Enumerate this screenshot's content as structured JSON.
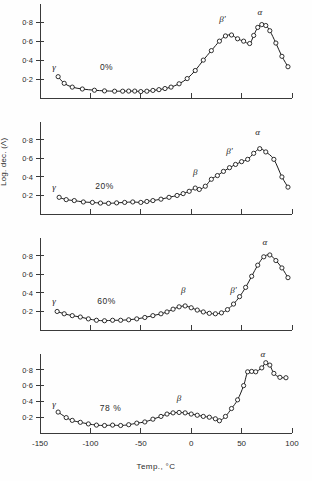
{
  "figure": {
    "xlabel": "Temp., °C",
    "ylabel": "Log. dec. (Λ)",
    "xticks": [
      "-150",
      "-100",
      "-50",
      "0",
      "50",
      "100"
    ],
    "xtick_values": [
      -150,
      -100,
      -50,
      0,
      50,
      100
    ],
    "yticks": [
      "0·2",
      "0·4",
      "0·6",
      "0·8"
    ],
    "ytick_values": [
      0.2,
      0.4,
      0.6,
      0.8
    ],
    "xlim": [
      -150,
      100
    ],
    "ylim": [
      0,
      0.95
    ],
    "grid": false,
    "legend": "none",
    "marker": "open-circle",
    "line_color": "#1a1a1a"
  },
  "chart_data": [
    {
      "type": "line",
      "title": "0%",
      "panel_label": "0%",
      "xlabel": "",
      "ylabel": "Log. dec. (Λ)",
      "xlim": [
        -150,
        100
      ],
      "ylim": [
        0,
        0.95
      ],
      "grid": false,
      "x": [
        -132,
        -126,
        -118,
        -108,
        -96,
        -86,
        -76,
        -68,
        -62,
        -56,
        -50,
        -44,
        -38,
        -32,
        -26,
        -20,
        -12,
        -4,
        4,
        12,
        20,
        28,
        34,
        40,
        46,
        52,
        58,
        62,
        66,
        70,
        74,
        78,
        84,
        90,
        96
      ],
      "y": [
        0.225,
        0.155,
        0.115,
        0.095,
        0.082,
        0.075,
        0.072,
        0.072,
        0.073,
        0.073,
        0.068,
        0.072,
        0.08,
        0.088,
        0.1,
        0.115,
        0.15,
        0.205,
        0.29,
        0.4,
        0.5,
        0.6,
        0.655,
        0.665,
        0.625,
        0.6,
        0.575,
        0.66,
        0.745,
        0.775,
        0.765,
        0.71,
        0.58,
        0.44,
        0.33
      ],
      "annotations": [
        {
          "text": "γ",
          "x": -136,
          "y": 0.3
        },
        {
          "text": "β'",
          "x": 31,
          "y": 0.8
        },
        {
          "text": "α",
          "x": 68,
          "y": 0.88
        },
        {
          "text": "0%",
          "x": -84,
          "y": 0.3
        }
      ]
    },
    {
      "type": "line",
      "title": "20%",
      "panel_label": "20%",
      "xlabel": "",
      "ylabel": "Log. dec. (Λ)",
      "xlim": [
        -150,
        100
      ],
      "ylim": [
        0,
        0.95
      ],
      "grid": false,
      "x": [
        -131,
        -124,
        -116,
        -107,
        -98,
        -90,
        -82,
        -74,
        -66,
        -58,
        -50,
        -44,
        -38,
        -30,
        -22,
        -14,
        -8,
        -2,
        4,
        8,
        14,
        20,
        26,
        32,
        38,
        44,
        50,
        56,
        62,
        68,
        74,
        82,
        90,
        96
      ],
      "y": [
        0.18,
        0.155,
        0.145,
        0.13,
        0.125,
        0.118,
        0.115,
        0.12,
        0.125,
        0.13,
        0.125,
        0.135,
        0.145,
        0.16,
        0.18,
        0.2,
        0.22,
        0.245,
        0.28,
        0.265,
        0.3,
        0.375,
        0.415,
        0.46,
        0.5,
        0.535,
        0.565,
        0.59,
        0.655,
        0.705,
        0.67,
        0.59,
        0.4,
        0.29
      ],
      "annotations": [
        {
          "text": "γ",
          "x": -136,
          "y": 0.26
        },
        {
          "text": "β",
          "x": 4,
          "y": 0.42
        },
        {
          "text": "β'",
          "x": 38,
          "y": 0.65
        },
        {
          "text": "α",
          "x": 66,
          "y": 0.85
        },
        {
          "text": "20%",
          "x": -86,
          "y": 0.27
        }
      ]
    },
    {
      "type": "line",
      "title": "60%",
      "panel_label": "60%",
      "xlabel": "",
      "ylabel": "Log. dec. (Λ)",
      "xlim": [
        -150,
        100
      ],
      "ylim": [
        0,
        0.95
      ],
      "grid": false,
      "x": [
        -133,
        -126,
        -118,
        -110,
        -102,
        -94,
        -86,
        -78,
        -70,
        -62,
        -54,
        -46,
        -38,
        -30,
        -24,
        -18,
        -12,
        -6,
        0,
        6,
        12,
        18,
        24,
        30,
        36,
        42,
        48,
        54,
        60,
        66,
        72,
        78,
        84,
        90,
        96
      ],
      "y": [
        0.2,
        0.175,
        0.155,
        0.14,
        0.12,
        0.105,
        0.1,
        0.105,
        0.105,
        0.11,
        0.12,
        0.135,
        0.155,
        0.175,
        0.195,
        0.225,
        0.25,
        0.26,
        0.24,
        0.215,
        0.195,
        0.18,
        0.175,
        0.185,
        0.22,
        0.28,
        0.36,
        0.46,
        0.58,
        0.7,
        0.79,
        0.81,
        0.75,
        0.67,
        0.565
      ],
      "annotations": [
        {
          "text": "γ",
          "x": -136,
          "y": 0.285
        },
        {
          "text": "β",
          "x": -8,
          "y": 0.4
        },
        {
          "text": "β'",
          "x": 42,
          "y": 0.4
        },
        {
          "text": "α",
          "x": 73,
          "y": 0.92
        },
        {
          "text": "60%",
          "x": -84,
          "y": 0.285
        }
      ]
    },
    {
      "type": "line",
      "title": "78 %",
      "panel_label": "78 %",
      "xlabel": "Temp., °C",
      "ylabel": "Log. dec. (Λ)",
      "xlim": [
        -150,
        100
      ],
      "ylim": [
        0,
        0.95
      ],
      "grid": false,
      "x": [
        -132,
        -124,
        -118,
        -110,
        -102,
        -94,
        -86,
        -78,
        -70,
        -62,
        -54,
        -46,
        -38,
        -30,
        -24,
        -18,
        -12,
        -6,
        0,
        6,
        12,
        18,
        24,
        28,
        34,
        40,
        46,
        52,
        56,
        60,
        64,
        70,
        74,
        78,
        82,
        88,
        94
      ],
      "y": [
        0.265,
        0.195,
        0.16,
        0.135,
        0.115,
        0.1,
        0.095,
        0.1,
        0.095,
        0.105,
        0.125,
        0.14,
        0.175,
        0.21,
        0.24,
        0.255,
        0.26,
        0.255,
        0.24,
        0.225,
        0.21,
        0.2,
        0.18,
        0.155,
        0.21,
        0.31,
        0.42,
        0.6,
        0.775,
        0.78,
        0.775,
        0.825,
        0.89,
        0.86,
        0.755,
        0.705,
        0.7
      ],
      "annotations": [
        {
          "text": "γ",
          "x": -136,
          "y": 0.33
        },
        {
          "text": "β",
          "x": -12,
          "y": 0.4
        },
        {
          "text": "α",
          "x": 71,
          "y": 0.96
        },
        {
          "text": "78 %",
          "x": -80,
          "y": 0.275
        }
      ]
    }
  ]
}
